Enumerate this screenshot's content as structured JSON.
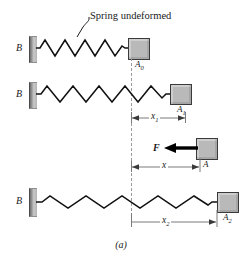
{
  "figure": {
    "caption": "(a)",
    "annotation": "Spring undeformed",
    "colors": {
      "spring": "#111111",
      "block_fill": "#b9b9b9",
      "block_stroke": "#3a3a3a",
      "wall_fill": "#b4b4b4",
      "dashed_line": "#9a9a9a",
      "dimension_line": "#7a7a7a",
      "force_arrow": "#000000",
      "background": "#ffffff"
    }
  },
  "rows": [
    {
      "id": "row-undeformed",
      "support_label": "B",
      "block_label": "A",
      "block_subscript": "0",
      "spring_state": "undeformed",
      "spring_coils": 9
    },
    {
      "id": "row-stretched-1",
      "support_label": "B",
      "block_label": "A",
      "block_subscript": "1",
      "spring_state": "stretched",
      "spring_coils": 8
    },
    {
      "id": "row-stretched-2",
      "support_label": "B",
      "block_label": "A",
      "block_subscript": "2",
      "spring_state": "stretched-more",
      "spring_coils": 7
    }
  ],
  "force": {
    "label": "F",
    "block_label": "A",
    "direction": "left"
  },
  "dimensions": [
    {
      "id": "dim-x1",
      "label": "x",
      "subscript": "1",
      "arrows": "both"
    },
    {
      "id": "dim-x",
      "label": "x",
      "subscript": "",
      "arrows": "both"
    },
    {
      "id": "dim-x2",
      "label": "x",
      "subscript": "2",
      "arrows": "right"
    }
  ]
}
